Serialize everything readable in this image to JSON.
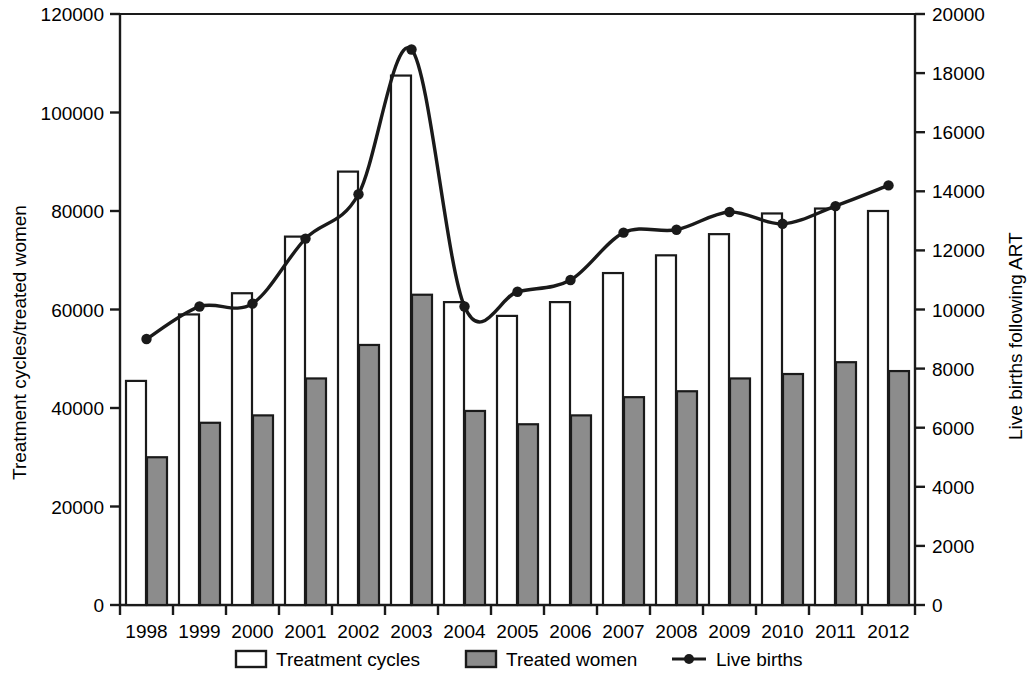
{
  "chart_data": {
    "type": "bar",
    "title": "",
    "subtitle": "",
    "categories": [
      "1998",
      "1999",
      "2000",
      "2001",
      "2002",
      "2003",
      "2004",
      "2005",
      "2006",
      "2007",
      "2008",
      "2009",
      "2010",
      "2011",
      "2012"
    ],
    "xlabel": "",
    "ylabel": "Treatment cycles/treated women",
    "y2label": "Live births following ART",
    "ylim": [
      0,
      120000
    ],
    "y2lim": [
      0,
      20000
    ],
    "yticks": [
      "0",
      "20000",
      "40000",
      "60000",
      "80000",
      "100000",
      "120000"
    ],
    "y2ticks": [
      "0",
      "2000",
      "4000",
      "6000",
      "8000",
      "10000",
      "12000",
      "14000",
      "16000",
      "18000",
      "20000"
    ],
    "grid": false,
    "legend_position": "bottom",
    "series": [
      {
        "name": "Treatment cycles",
        "kind": "bar",
        "axis": "left",
        "fill": "#ffffff",
        "stroke": "#1a1a1a",
        "values": [
          45500,
          59000,
          63300,
          74800,
          88000,
          107500,
          61500,
          58700,
          61500,
          67400,
          71000,
          75300,
          79500,
          80500,
          80000
        ]
      },
      {
        "name": "Treated women",
        "kind": "bar",
        "axis": "left",
        "fill": "#8c8c8c",
        "stroke": "#1a1a1a",
        "values": [
          30000,
          37000,
          38500,
          46000,
          52800,
          63000,
          39400,
          36700,
          38500,
          42200,
          43400,
          46000,
          46900,
          49300,
          47500
        ]
      },
      {
        "name": "Live births",
        "kind": "line",
        "axis": "right",
        "stroke": "#1a1a1a",
        "marker": "circle",
        "values": [
          9000,
          10100,
          10200,
          12400,
          13900,
          18800,
          10100,
          10600,
          11000,
          12600,
          12700,
          13300,
          12900,
          13500,
          14200
        ]
      }
    ]
  },
  "legend": {
    "items": [
      {
        "label": "Treatment cycles",
        "swatch": "open-box-swatch"
      },
      {
        "label": "Treated women",
        "swatch": "filled-box-swatch"
      },
      {
        "label": "Live births",
        "swatch": "line-marker-swatch"
      }
    ]
  },
  "colors": {
    "axis": "#1a1a1a",
    "bar_open_fill": "#ffffff",
    "bar_filled_fill": "#8c8c8c",
    "line": "#1a1a1a",
    "background": "#ffffff"
  }
}
